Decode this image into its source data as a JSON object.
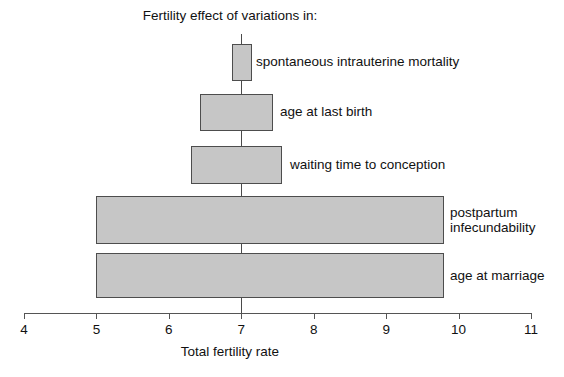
{
  "chart_data": {
    "type": "bar",
    "orientation": "horizontal",
    "title": "Fertility effect of variations in:",
    "xlabel": "Total fertility rate",
    "ylabel": "",
    "xlim": [
      4,
      11
    ],
    "xticks": [
      4,
      5,
      6,
      7,
      8,
      9,
      10,
      11
    ],
    "xtick_labels": [
      "4",
      "5",
      "6",
      "7",
      "8",
      "9",
      "10",
      "11"
    ],
    "grid": false,
    "legend": null,
    "reference_line": 7,
    "bar_fill_color": "#c6c6c6",
    "bar_border_color": "#4d4d4d",
    "categories": [
      "spontaneous intrauterine mortality",
      "age at last birth",
      "waiting time to conception",
      "postpartum infecundability",
      "age at marriage"
    ],
    "bars": [
      {
        "label": "spontaneous intrauterine mortality",
        "label_lines": "spontaneous intrauterine mortality",
        "start": 6.87,
        "end": 7.15,
        "span": 0.28
      },
      {
        "label": "age at last birth",
        "label_lines": "age at last birth",
        "start": 6.43,
        "end": 7.44,
        "span": 1.01
      },
      {
        "label": "waiting time to conception",
        "label_lines": "waiting time to conception",
        "start": 6.3,
        "end": 7.56,
        "span": 1.26
      },
      {
        "label": "postpartum infecundability",
        "label_lines": "postpartum\ninfecundability",
        "start": 5.0,
        "end": 9.8,
        "span": 4.8
      },
      {
        "label": "age at marriage",
        "label_lines": "age at marriage",
        "start": 5.0,
        "end": 9.8,
        "span": 4.8
      }
    ]
  },
  "layout": {
    "axis_x_start_px": 24,
    "axis_x_end_px": 531,
    "px_per_unit": 72.43,
    "axis_y_px": 313,
    "reference_line_top_px": 34,
    "bar_rows": [
      {
        "top": 44,
        "height": 37
      },
      {
        "top": 94,
        "height": 37
      },
      {
        "top": 146,
        "height": 38
      },
      {
        "top": 196,
        "height": 48
      },
      {
        "top": 253,
        "height": 45
      }
    ],
    "label_offsets": [
      {
        "x": 256,
        "y": 54
      },
      {
        "x": 280,
        "y": 104
      },
      {
        "x": 290,
        "y": 157
      },
      {
        "x": 450,
        "y": 205
      },
      {
        "x": 450,
        "y": 268
      }
    ]
  }
}
